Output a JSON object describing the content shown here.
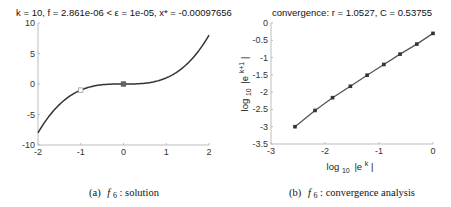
{
  "charts": [
    {
      "title": "k = 10, f = 2.861e-06 < ε = 1e-05, x* = -0.00097656",
      "caption_prefix": "(a)",
      "caption_func": "f",
      "caption_sub": "6",
      "caption_rest": ": solution"
    },
    {
      "title": "convergence: r = 1.0527, C = 0.53755",
      "caption_prefix": "(b)",
      "caption_func": "f",
      "caption_sub": "6",
      "caption_rest": ": convergence analysis",
      "xlabel_main": "log",
      "xlabel_sub": "10",
      "xlabel_arg": "|e",
      "xlabel_sup": "k",
      "xlabel_end": "|",
      "ylabel_main": "log",
      "ylabel_sub": "10",
      "ylabel_arg": "|e",
      "ylabel_sup": "k+1",
      "ylabel_end": "|"
    }
  ],
  "chart_data": [
    {
      "type": "line",
      "title": "k = 10, f = 2.861e-06 < ε = 1e-05, x* = -0.00097656",
      "xlabel": "",
      "ylabel": "",
      "function": "x^3",
      "xlim": [
        -2,
        2
      ],
      "ylim": [
        -10,
        10
      ],
      "xticks": [
        -2,
        -1,
        0,
        1,
        2
      ],
      "yticks": [
        -10,
        -5,
        0,
        5,
        10
      ],
      "xtick_labels": [
        "-2",
        "-1",
        "0",
        "1",
        "2"
      ],
      "ytick_labels": [
        "-10",
        "-5",
        "0",
        "5",
        "10"
      ],
      "series": [
        {
          "name": "f(x)",
          "x": [
            -2,
            -1.75,
            -1.5,
            -1.25,
            -1,
            -0.75,
            -0.5,
            -0.25,
            0,
            0.25,
            0.5,
            0.75,
            1,
            1.25,
            1.5,
            1.75,
            2
          ],
          "y": [
            -8,
            -5.359,
            -3.375,
            -1.953,
            -1,
            -0.422,
            -0.125,
            -0.016,
            0,
            0.016,
            0.125,
            0.422,
            1,
            1.953,
            3.375,
            5.359,
            8
          ]
        }
      ],
      "markers": [
        {
          "name": "start",
          "x": -1,
          "y": -1,
          "style": "open-square"
        },
        {
          "name": "solution",
          "x": -0.00097656,
          "y": 0,
          "style": "filled-square"
        }
      ],
      "grid": false
    },
    {
      "type": "line",
      "title": "convergence: r = 1.0527, C = 0.53755",
      "xlabel": "log10 |e^k|",
      "ylabel": "log10 |e^(k+1)|",
      "xlim": [
        -3,
        0
      ],
      "ylim": [
        -3.5,
        0
      ],
      "xticks": [
        -3,
        -2,
        -1,
        0
      ],
      "yticks": [
        -3.5,
        -3,
        -2.5,
        -2,
        -1.5,
        -1,
        -0.5,
        0
      ],
      "xtick_labels": [
        "-3",
        "-2",
        "-1",
        "0"
      ],
      "ytick_labels": [
        "-3.5",
        "-3",
        "-2.5",
        "-2",
        "-1.5",
        "-1",
        "-0.5",
        "0"
      ],
      "series": [
        {
          "name": "iterates",
          "x": [
            -2.556,
            -2.185,
            -1.86,
            -1.53,
            -1.22,
            -0.91,
            -0.61,
            -0.3,
            0.0
          ],
          "y": [
            -3.0,
            -2.53,
            -2.16,
            -1.83,
            -1.51,
            -1.2,
            -0.9,
            -0.61,
            -0.3
          ]
        }
      ],
      "fit": {
        "r": 1.0527,
        "C": 0.53755
      },
      "grid": false
    }
  ]
}
